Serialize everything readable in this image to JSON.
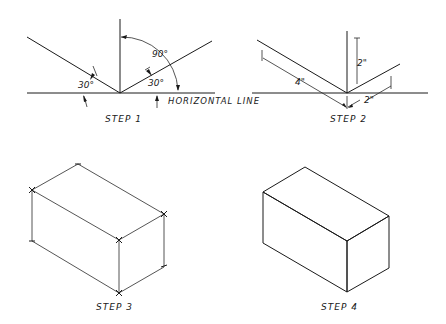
{
  "steps": [
    {
      "label": "STEP 1",
      "annotations": {
        "angle_left": "30°",
        "angle_right": "30°",
        "angle_top": "90°",
        "horizontal_label": "HORIZONTAL LINE"
      }
    },
    {
      "label": "STEP 2",
      "annotations": {
        "dim_left": "4\"",
        "dim_vertical": "2\"",
        "dim_right": "2\""
      }
    },
    {
      "label": "STEP 3"
    },
    {
      "label": "STEP 4"
    }
  ],
  "colors": {
    "line": "#1a1a1a",
    "background": "#ffffff"
  }
}
